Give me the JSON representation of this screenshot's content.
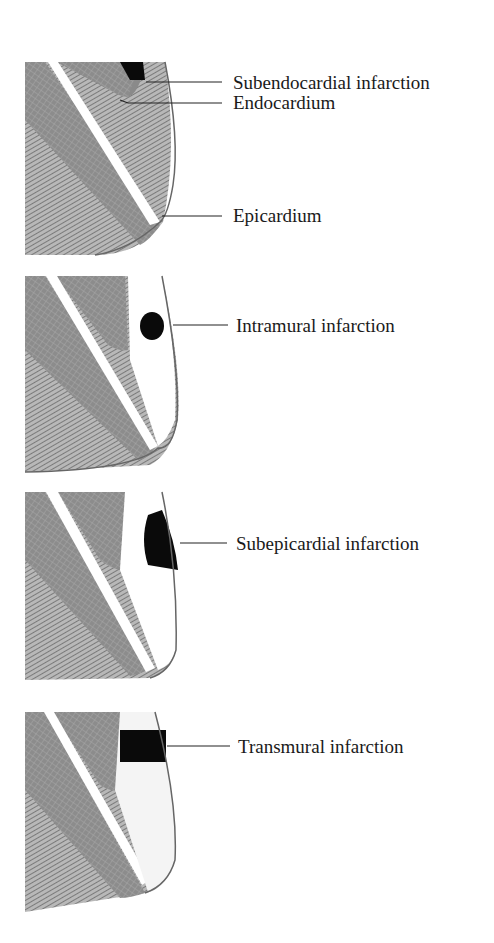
{
  "diagram": {
    "colors": {
      "muscle": "#8a8a8a",
      "infarct": "#0a0a0a",
      "line": "#555555",
      "text": "#1a1a1a",
      "background": "#ffffff"
    },
    "panels": [
      {
        "id": "subendocardial",
        "labels": [
          {
            "text": "Subendocardial infarction",
            "target": "infarct region"
          },
          {
            "text": "Endocardium",
            "target": "inner wall surface"
          },
          {
            "text": "Epicardium",
            "target": "outer wall surface"
          }
        ]
      },
      {
        "id": "intramural",
        "labels": [
          {
            "text": "Intramural infarction",
            "target": "infarct region"
          }
        ]
      },
      {
        "id": "subepicardial",
        "labels": [
          {
            "text": "Subepicardial infarction",
            "target": "infarct region"
          }
        ]
      },
      {
        "id": "transmural",
        "labels": [
          {
            "text": "Transmural infarction",
            "target": "infarct region"
          }
        ]
      }
    ]
  }
}
